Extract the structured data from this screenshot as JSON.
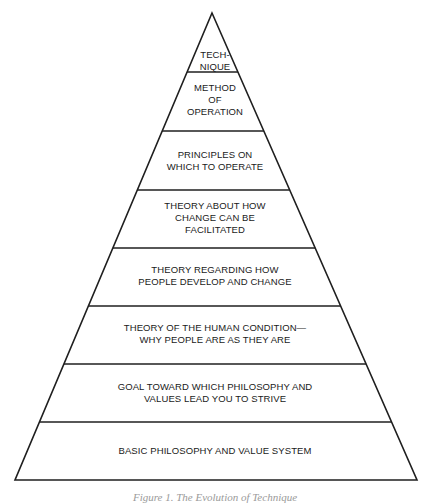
{
  "diagram": {
    "type": "pyramid",
    "apex": [
      212,
      13
    ],
    "base_left": [
      15,
      480
    ],
    "base_right": [
      417,
      480
    ],
    "stroke_color": "#1f1f1f",
    "divider_y": [
      72,
      131,
      190,
      248,
      306,
      364,
      422
    ],
    "tiers": [
      {
        "label": "TECH-\nNIQUE",
        "top": 49
      },
      {
        "label": "METHOD\nOF\nOPERATION",
        "top": 82
      },
      {
        "label": "PRINCIPLES ON\nWHICH TO OPERATE",
        "top": 149
      },
      {
        "label": "THEORY ABOUT HOW\nCHANGE CAN BE\nFACILITATED",
        "top": 200
      },
      {
        "label": "THEORY REGARDING HOW\nPEOPLE DEVELOP AND CHANGE",
        "top": 264
      },
      {
        "label": "THEORY OF THE HUMAN CONDITION—\nWHY PEOPLE ARE AS THEY ARE",
        "top": 322
      },
      {
        "label": "GOAL TOWARD WHICH PHILOSOPHY AND\nVALUES LEAD YOU TO STRIVE",
        "top": 381
      },
      {
        "label": "BASIC PHILOSOPHY AND VALUE SYSTEM",
        "top": 445
      }
    ],
    "caption": "Figure 1. The Evolution of Technique"
  }
}
